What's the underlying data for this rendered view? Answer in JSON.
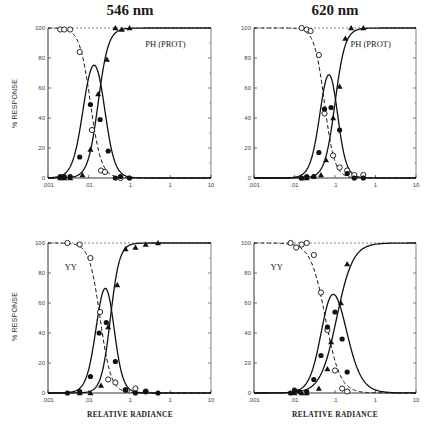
{
  "figure": {
    "column_titles": [
      "546 nm",
      "620 nm"
    ],
    "y_axis_label": "% RESPONSE",
    "x_axis_label": "RELATIVE RADIANCE",
    "x_tick_labels": [
      ".001",
      ".01",
      ".1",
      "1",
      "10"
    ],
    "y_tick_labels": [
      "0",
      "20",
      "40",
      "60",
      "80",
      "100"
    ]
  },
  "chart_data": [
    {
      "type": "scatter",
      "title": "546 nm",
      "panel_label": "PH (PROT)",
      "xlabel": "",
      "ylabel": "% RESPONSE",
      "xscale": "log",
      "xlim": [
        0.001,
        10
      ],
      "ylim": [
        0,
        100
      ],
      "frame": {
        "x": 48,
        "y": 28,
        "w": 163,
        "h": 150
      },
      "label_pos": {
        "x": 0.72,
        "y": 0.9
      },
      "series": [
        {
          "name": "open circles",
          "marker": "open-circle",
          "line": "dashed",
          "points": [
            [
              0.002,
              99
            ],
            [
              0.0025,
              99
            ],
            [
              0.0035,
              99
            ],
            [
              0.006,
              84
            ],
            [
              0.012,
              32
            ],
            [
              0.02,
              5
            ],
            [
              0.025,
              4
            ],
            [
              0.06,
              0
            ]
          ],
          "curve": {
            "kind": "falling",
            "x50": 0.011,
            "slope": 7.5
          }
        },
        {
          "name": "filled circles",
          "marker": "filled-circle",
          "line": "solid",
          "points": [
            [
              0.002,
              1
            ],
            [
              0.0025,
              1
            ],
            [
              0.0035,
              1
            ],
            [
              0.006,
              14
            ],
            [
              0.011,
              49
            ],
            [
              0.019,
              39
            ],
            [
              0.03,
              18
            ],
            [
              0.045,
              0
            ],
            [
              0.06,
              1
            ],
            [
              0.1,
              0
            ]
          ],
          "curve": {
            "kind": "bell",
            "x50a": 0.0075,
            "x50b": 0.024,
            "slopea": 7.5,
            "slopeb": 8
          }
        },
        {
          "name": "filled triangles",
          "marker": "filled-triangle",
          "line": "solid",
          "points": [
            [
              0.002,
              0
            ],
            [
              0.0025,
              0
            ],
            [
              0.0035,
              0
            ],
            [
              0.007,
              2
            ],
            [
              0.011,
              19
            ],
            [
              0.017,
              56
            ],
            [
              0.028,
              79
            ],
            [
              0.045,
              100
            ],
            [
              0.065,
              99
            ],
            [
              0.1,
              100
            ]
          ],
          "curve": {
            "kind": "rising",
            "x50": 0.017,
            "slope": 8
          }
        }
      ]
    },
    {
      "type": "scatter",
      "title": "620 nm",
      "panel_label": "PH (PROT)",
      "xlabel": "",
      "ylabel": "",
      "xscale": "log",
      "xlim": [
        0.001,
        10
      ],
      "ylim": [
        0,
        100
      ],
      "frame": {
        "x": 254,
        "y": 28,
        "w": 162,
        "h": 150
      },
      "label_pos": {
        "x": 0.72,
        "y": 0.9
      },
      "series": [
        {
          "name": "open circles",
          "marker": "open-circle",
          "line": "dashed",
          "points": [
            [
              0.015,
              100
            ],
            [
              0.02,
              99
            ],
            [
              0.025,
              98
            ],
            [
              0.04,
              82
            ],
            [
              0.055,
              43
            ],
            [
              0.09,
              15
            ],
            [
              0.13,
              7
            ],
            [
              0.2,
              5
            ],
            [
              0.3,
              2
            ],
            [
              0.5,
              2
            ]
          ],
          "curve": {
            "kind": "falling",
            "x50": 0.055,
            "slope": 8
          }
        },
        {
          "name": "filled circles",
          "marker": "filled-circle",
          "line": "solid",
          "points": [
            [
              0.015,
              0
            ],
            [
              0.02,
              1
            ],
            [
              0.03,
              1
            ],
            [
              0.04,
              17
            ],
            [
              0.055,
              46
            ],
            [
              0.08,
              47
            ],
            [
              0.13,
              32
            ],
            [
              0.2,
              3
            ],
            [
              0.3,
              0
            ],
            [
              0.5,
              0
            ]
          ],
          "curve": {
            "kind": "bell",
            "x50a": 0.045,
            "x50b": 0.11,
            "slopea": 8,
            "slopeb": 9
          }
        },
        {
          "name": "filled triangles",
          "marker": "filled-triangle",
          "line": "solid",
          "points": [
            [
              0.015,
              0
            ],
            [
              0.02,
              0
            ],
            [
              0.03,
              1
            ],
            [
              0.045,
              2
            ],
            [
              0.06,
              12
            ],
            [
              0.09,
              40
            ],
            [
              0.13,
              61
            ],
            [
              0.18,
              93
            ],
            [
              0.25,
              100
            ],
            [
              0.5,
              100
            ]
          ],
          "curve": {
            "kind": "rising",
            "x50": 0.1,
            "slope": 8
          }
        }
      ]
    },
    {
      "type": "scatter",
      "title": "546 nm",
      "panel_label": "YY",
      "xlabel": "RELATIVE RADIANCE",
      "ylabel": "% RESPONSE",
      "xscale": "log",
      "xlim": [
        0.001,
        10
      ],
      "ylim": [
        0,
        100
      ],
      "frame": {
        "x": 48,
        "y": 243,
        "w": 163,
        "h": 150
      },
      "label_pos": {
        "x": 0.14,
        "y": 0.85
      },
      "series": [
        {
          "name": "open circles",
          "marker": "open-circle",
          "line": "dashed",
          "points": [
            [
              0.003,
              100
            ],
            [
              0.006,
              99
            ],
            [
              0.011,
              90
            ],
            [
              0.019,
              54
            ],
            [
              0.03,
              9
            ],
            [
              0.045,
              7
            ],
            [
              0.08,
              2
            ],
            [
              0.14,
              3
            ],
            [
              0.25,
              1
            ]
          ],
          "curve": {
            "kind": "falling",
            "x50": 0.019,
            "slope": 7.5
          }
        },
        {
          "name": "filled circles",
          "marker": "filled-circle",
          "line": "solid",
          "points": [
            [
              0.003,
              0
            ],
            [
              0.006,
              1
            ],
            [
              0.011,
              11
            ],
            [
              0.018,
              40
            ],
            [
              0.027,
              47
            ],
            [
              0.045,
              21
            ],
            [
              0.08,
              2
            ],
            [
              0.14,
              0
            ],
            [
              0.25,
              1
            ],
            [
              0.5,
              0
            ]
          ],
          "curve": {
            "kind": "bell",
            "x50a": 0.016,
            "x50b": 0.04,
            "slopea": 8,
            "slopeb": 9
          }
        },
        {
          "name": "filled triangles",
          "marker": "filled-triangle",
          "line": "solid",
          "points": [
            [
              0.006,
              0
            ],
            [
              0.011,
              0
            ],
            [
              0.02,
              5
            ],
            [
              0.03,
              44
            ],
            [
              0.05,
              72
            ],
            [
              0.08,
              96
            ],
            [
              0.14,
              97
            ],
            [
              0.25,
              99
            ],
            [
              0.5,
              100
            ]
          ],
          "curve": {
            "kind": "rising",
            "x50": 0.034,
            "slope": 9
          }
        }
      ]
    },
    {
      "type": "scatter",
      "title": "620 nm",
      "panel_label": "YY",
      "xlabel": "RELATIVE RADIANCE",
      "ylabel": "",
      "xscale": "log",
      "xlim": [
        0.001,
        10
      ],
      "ylim": [
        0,
        100
      ],
      "frame": {
        "x": 254,
        "y": 243,
        "w": 162,
        "h": 150
      },
      "label_pos": {
        "x": 0.14,
        "y": 0.85
      },
      "series": [
        {
          "name": "open circles",
          "marker": "open-circle",
          "line": "dashed",
          "points": [
            [
              0.008,
              100
            ],
            [
              0.011,
              97
            ],
            [
              0.015,
              99
            ],
            [
              0.02,
              100
            ],
            [
              0.03,
              92
            ],
            [
              0.045,
              67
            ],
            [
              0.065,
              42
            ],
            [
              0.1,
              15
            ],
            [
              0.15,
              3
            ],
            [
              0.2,
              1
            ]
          ],
          "curve": {
            "kind": "falling",
            "x50": 0.058,
            "slope": 5.5
          }
        },
        {
          "name": "filled circles",
          "marker": "filled-circle",
          "line": "solid",
          "points": [
            [
              0.008,
              0
            ],
            [
              0.01,
              2
            ],
            [
              0.013,
              1
            ],
            [
              0.02,
              1
            ],
            [
              0.03,
              9
            ],
            [
              0.045,
              25
            ],
            [
              0.065,
              44
            ],
            [
              0.1,
              54
            ],
            [
              0.15,
              36
            ],
            [
              0.2,
              14
            ]
          ],
          "curve": {
            "kind": "bell",
            "x50a": 0.05,
            "x50b": 0.17,
            "slopea": 6.5,
            "slopeb": 5
          }
        },
        {
          "name": "filled triangles",
          "marker": "filled-triangle",
          "line": "solid",
          "points": [
            [
              0.01,
              0
            ],
            [
              0.015,
              0
            ],
            [
              0.02,
              0
            ],
            [
              0.04,
              3
            ],
            [
              0.065,
              16
            ],
            [
              0.08,
              34
            ],
            [
              0.14,
              60
            ],
            [
              0.2,
              86
            ]
          ],
          "curve": {
            "kind": "rising",
            "x50": 0.11,
            "slope": 5
          }
        }
      ]
    }
  ]
}
